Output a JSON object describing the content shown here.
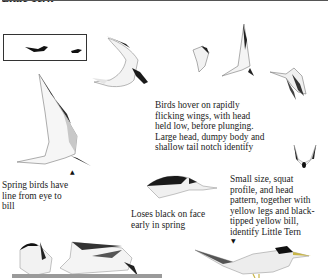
{
  "page": {
    "title": "Little Tern"
  },
  "captions": {
    "hover": "Birds hover on rapidly flicking wings, with head held low, before plunging. Large head, dumpy body and shallow tail notch identify",
    "hover_lines": [
      "Birds hover on rapidly",
      "flicking wings, with head",
      "held low, before plunging.",
      "Large head, dumpy body and",
      "shallow tail notch identify"
    ],
    "spring": "Spring birds have line from eye to bill",
    "spring_lines": [
      "Spring birds have",
      "line from eye to",
      "bill"
    ],
    "loses": "Loses black on face early in spring",
    "loses_lines": [
      "Loses black on face",
      "early in spring"
    ],
    "identify": "Small size, squat profile, and head pattern, together with yellow legs and black-tipped yellow bill, identify Little Tern",
    "identify_lines": [
      "Small size, squat",
      "profile, and head",
      "pattern, together with",
      "yellow legs and black-",
      "tipped yellow bill,",
      "identify Little Tern"
    ]
  },
  "markers": {
    "up_arrow": "▲",
    "down_arrow": "▼"
  },
  "colors": {
    "ink": "#1a1a1a",
    "wing_grey": "#c9c9c9",
    "cap_black": "#111111",
    "bill_yellow": "#d8c65a"
  }
}
